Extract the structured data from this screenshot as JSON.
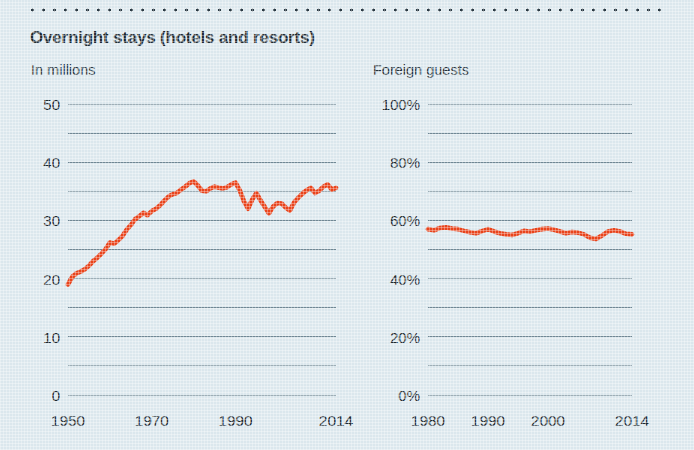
{
  "header": {
    "title": "Overnight stays (hotels and resorts)",
    "rule": "dotted-rule"
  },
  "theme": {
    "background": "#dbe7ed",
    "line_color": "#e8441c",
    "grid_color": "#6f8794",
    "text_color": "#1d2a32"
  },
  "chart_data": [
    {
      "type": "line",
      "id": "overnight-stays-millions",
      "title": "Overnight stays (hotels and resorts)",
      "subtitle": "In millions",
      "xlabel": "",
      "ylabel": "In millions",
      "ylim": [
        0,
        50
      ],
      "xlim": [
        1950,
        2014
      ],
      "grid": true,
      "grid_step": 5,
      "legend": "none",
      "ytick_labels": [
        "0",
        "10",
        "20",
        "30",
        "40",
        "50"
      ],
      "ytick_values": [
        0,
        10,
        20,
        30,
        40,
        50
      ],
      "xtick_labels": [
        "1950",
        "1970",
        "1990",
        "2014"
      ],
      "xtick_values": [
        1950,
        1970,
        1990,
        2014
      ],
      "series": [
        {
          "name": "Overnight stays",
          "color": "#e8441c",
          "x": [
            1950,
            1951,
            1952,
            1953,
            1954,
            1955,
            1956,
            1957,
            1958,
            1959,
            1960,
            1961,
            1962,
            1963,
            1964,
            1965,
            1966,
            1967,
            1968,
            1969,
            1970,
            1971,
            1972,
            1973,
            1974,
            1975,
            1976,
            1977,
            1978,
            1979,
            1980,
            1981,
            1982,
            1983,
            1984,
            1985,
            1986,
            1987,
            1988,
            1989,
            1990,
            1991,
            1992,
            1993,
            1994,
            1995,
            1996,
            1997,
            1998,
            1999,
            2000,
            2001,
            2002,
            2003,
            2004,
            2005,
            2006,
            2007,
            2008,
            2009,
            2010,
            2011,
            2012,
            2013,
            2014
          ],
          "values": [
            19.0,
            20.3,
            20.9,
            21.2,
            21.6,
            22.2,
            23.0,
            23.6,
            24.3,
            25.1,
            26.2,
            26.0,
            26.6,
            27.3,
            28.4,
            29.2,
            30.2,
            30.7,
            31.3,
            30.9,
            31.6,
            32.0,
            32.6,
            33.4,
            34.1,
            34.5,
            34.7,
            35.3,
            35.8,
            36.4,
            36.7,
            36.0,
            35.1,
            35.0,
            35.5,
            35.8,
            35.6,
            35.5,
            35.7,
            36.2,
            36.5,
            35.2,
            33.3,
            32.0,
            33.6,
            34.7,
            33.4,
            32.3,
            31.2,
            32.4,
            33.0,
            32.9,
            32.2,
            31.7,
            33.1,
            33.9,
            34.6,
            35.2,
            35.6,
            34.7,
            35.1,
            35.8,
            36.2,
            35.3,
            35.6
          ]
        }
      ]
    },
    {
      "type": "line",
      "id": "foreign-guests-percent",
      "title": "Foreign guests",
      "subtitle": "Foreign guests",
      "xlabel": "",
      "ylabel": "Percent",
      "ylim": [
        0,
        100
      ],
      "xlim": [
        1980,
        2014
      ],
      "grid": true,
      "grid_step": 10,
      "legend": "none",
      "ytick_labels": [
        "0%",
        "20%",
        "40%",
        "60%",
        "80%",
        "100%"
      ],
      "ytick_values": [
        0,
        20,
        40,
        60,
        80,
        100
      ],
      "xtick_labels": [
        "1980",
        "1990",
        "2000",
        "2014"
      ],
      "xtick_values": [
        1980,
        1990,
        2000,
        2014
      ],
      "series": [
        {
          "name": "Foreign guests",
          "color": "#e8441c",
          "x": [
            1980,
            1981,
            1982,
            1983,
            1984,
            1985,
            1986,
            1987,
            1988,
            1989,
            1990,
            1991,
            1992,
            1993,
            1994,
            1995,
            1996,
            1997,
            1998,
            1999,
            2000,
            2001,
            2002,
            2003,
            2004,
            2005,
            2006,
            2007,
            2008,
            2009,
            2010,
            2011,
            2012,
            2013,
            2014
          ],
          "values": [
            57.0,
            56.6,
            57.4,
            57.6,
            57.2,
            57.0,
            56.4,
            55.9,
            55.6,
            56.3,
            57.0,
            56.2,
            55.6,
            55.2,
            55.0,
            55.6,
            56.4,
            56.1,
            56.6,
            57.0,
            57.2,
            56.8,
            56.2,
            55.6,
            56.0,
            55.8,
            55.2,
            54.0,
            53.6,
            54.8,
            56.2,
            56.6,
            56.2,
            55.4,
            55.2
          ]
        }
      ]
    }
  ]
}
